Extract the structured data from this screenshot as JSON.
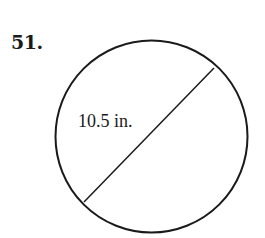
{
  "problem": {
    "number": "51."
  },
  "figure": {
    "shape": "circle",
    "segment": "diameter",
    "label": "10.5 in.",
    "measurement": {
      "value": 10.5,
      "unit": "in."
    },
    "stroke_color": "#1a1a1a",
    "fill_color": "#ffffff"
  }
}
